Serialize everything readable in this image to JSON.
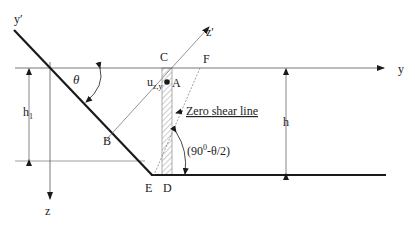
{
  "diagram": {
    "labels": {
      "y_prime": "y′",
      "y": "y",
      "z": "z",
      "z_prime": "z′",
      "theta": "θ",
      "h1_main": "h",
      "h1_sub": "1",
      "h": "h",
      "B": "B",
      "C": "C",
      "A": "A",
      "F": "F",
      "E": "E",
      "D": "D",
      "u_main": "u",
      "u_sub": "z,y",
      "zero_shear": "Zero shear line",
      "angle_expr_pre": "(90",
      "angle_expr_sup": "0",
      "angle_expr_post": "-θ/2)"
    },
    "colors": {
      "line": "#1a1a1a",
      "thin_line": "#555555",
      "hatch": "#9a9a9a"
    }
  }
}
